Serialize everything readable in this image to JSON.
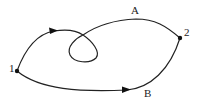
{
  "diagram": {
    "type": "path-diagram",
    "nodes": [
      {
        "id": "1",
        "label": "1",
        "x": 17,
        "y": 71
      },
      {
        "id": "2",
        "label": "2",
        "x": 180,
        "y": 38
      }
    ],
    "paths": [
      {
        "id": "A",
        "label": "A",
        "from": "1",
        "to": "2",
        "has_loop": true,
        "arrow_direction": "from 1 toward 2"
      },
      {
        "id": "B",
        "label": "B",
        "from": "1",
        "to": "2",
        "has_loop": false,
        "arrow_direction": "from 1 toward 2"
      }
    ],
    "colors": {
      "stroke": "#222222",
      "background": "#ffffff"
    }
  },
  "labels": {
    "node1": "1",
    "node2": "2",
    "pathA": "A",
    "pathB": "B"
  }
}
